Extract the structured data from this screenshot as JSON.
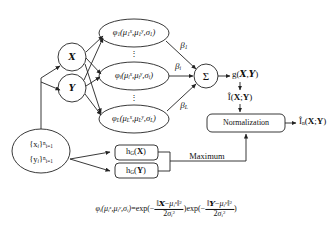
{
  "diagram": {
    "background": "#ffffff",
    "stroke": "#222222"
  },
  "input_node": {
    "line1": "{x",
    "line1_sub": "i",
    "line1_close": "}",
    "line1_sup": "n",
    "line1_subrange": "i=1",
    "line2": "{y",
    "line2_sub": "i",
    "line2_close": "}",
    "line2_sup": "n",
    "line2_subrange": "i=1"
  },
  "feature_nodes": [
    {
      "label": "X",
      "name": "script-x-node"
    },
    {
      "label": "Y",
      "name": "script-y-node"
    }
  ],
  "hidden_units": [
    {
      "fn": "φ",
      "fn_sub": "1",
      "args": "(μ",
      "mu1_sub": "1",
      "mu1_sup": "x",
      "mu2_sub": "1",
      "mu2_sup": "y",
      "sigma": "σ",
      "sigma_sub": "1",
      "weight": "β",
      "weight_sub": "1"
    },
    {
      "fn": "φ",
      "fn_sub": "i",
      "args": "(μ",
      "mu1_sub": "i",
      "mu1_sup": "x",
      "mu2_sub": "i",
      "mu2_sup": "y",
      "sigma": "σ",
      "sigma_sub": "i",
      "weight": "β",
      "weight_sub": "i"
    },
    {
      "fn": "φ",
      "fn_sub": "L",
      "args": "(μ",
      "mu1_sub": "L",
      "mu1_sup": "x",
      "mu2_sub": "L",
      "mu2_sup": "y",
      "sigma": "σ",
      "sigma_sub": "L",
      "weight": "β",
      "weight_sub": "L"
    }
  ],
  "vertical_dots": "⋮",
  "sum_node": {
    "symbol": "Σ"
  },
  "outputs": {
    "g_label": "g(",
    "g_x": "X",
    "g_comma": ",",
    "g_y": "Y",
    "g_close": ")",
    "mi_hat": "Î(",
    "mi_hat_x": "X",
    "mi_hat_sep": ";",
    "mi_hat_y": "Y",
    "mi_hat_close": ")",
    "mi_norm": "Î",
    "mi_norm_sub": "n",
    "mi_norm_open": "(",
    "mi_norm_x": "X",
    "mi_norm_sep": ";",
    "mi_norm_y": "Y",
    "mi_norm_close": ")"
  },
  "normalization_box": {
    "label": "Normalization"
  },
  "bandwidth_boxes": [
    {
      "fn": "h",
      "fn_sub": "G",
      "arg_open": "(",
      "arg": "X",
      "arg_close": ")"
    },
    {
      "fn": "h",
      "fn_sub": "G",
      "arg_open": "(",
      "arg": "Y",
      "arg_close": ")"
    }
  ],
  "maximum_label": "Maximum",
  "equation": {
    "lhs_fn": "φ",
    "lhs_fn_sub": "i",
    "lhs_open": "(μ",
    "lhs_mu1_sub": "i",
    "lhs_mu1_sup": "x",
    "lhs_mu2_sub": "i",
    "lhs_mu2_sup": "y",
    "lhs_sigma": "σ",
    "lhs_sigma_sub": "i",
    "equals": "=",
    "exp1": "exp(−",
    "num1_open": "‖",
    "num1_x": "X",
    "num1_minus": "−",
    "num1_mu": "μ",
    "num1_mu_sub": "i",
    "num1_mu_sup": "x",
    "num1_close": "‖",
    "num1_pow": "2",
    "den1_two": "2",
    "den1_sigma": "σ",
    "den1_sigma_sub": "i",
    "den1_sigma_sup": "2",
    "mid": ")exp(−",
    "num2_open": "‖",
    "num2_y": "Y",
    "num2_minus": "−",
    "num2_mu": "μ",
    "num2_mu_sub": "i",
    "num2_mu_sup": "y",
    "num2_close": "‖",
    "num2_pow": "2",
    "den2_two": "2",
    "den2_sigma": "σ",
    "den2_sigma_sub": "i",
    "den2_sigma_sup": "2",
    "tail": ")"
  }
}
